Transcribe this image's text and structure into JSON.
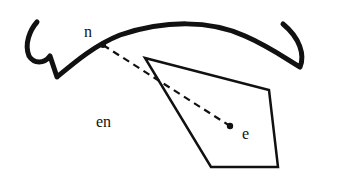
{
  "diagram": {
    "labels": {
      "n": "n",
      "e": "e",
      "en": "en"
    },
    "colors": {
      "stroke": "#111111",
      "background": "#ffffff"
    },
    "elements": {
      "curve": "thick curved arc with hooked ends",
      "polygon": "quadrilateral",
      "dashed_segment": "dashed line from point n to point e"
    }
  }
}
